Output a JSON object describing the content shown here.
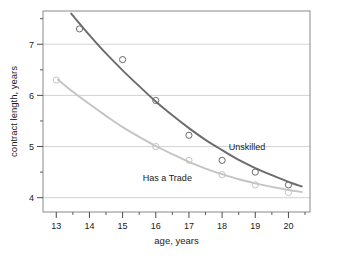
{
  "chart_data": {
    "type": "scatter",
    "title": "",
    "subtitle": "",
    "xlabel": "age, years",
    "ylabel": "contract length, years",
    "xlim": [
      12.6,
      20.65
    ],
    "ylim": [
      3.72,
      7.65
    ],
    "xticks": [
      13,
      14,
      15,
      16,
      17,
      18,
      19,
      20
    ],
    "xticklabels": [
      "13",
      "14",
      "15",
      "16",
      "17",
      "18",
      "19",
      "20"
    ],
    "yticks": [
      4,
      5,
      6,
      7
    ],
    "yticklabels": [
      "4",
      "5",
      "6",
      "7"
    ],
    "xminorticks": [
      13.5,
      14.5,
      15.5,
      16.5,
      17.5,
      18.5,
      19.5,
      20.5
    ],
    "yminorticks": [
      4.5,
      5.5,
      6.5,
      7.5
    ],
    "grid": "horizontal-major",
    "legend_position": "inline-annotations",
    "series": [
      {
        "name": "Unskilled",
        "color": "#6b6b6b",
        "marker": "open-circle",
        "annotation": "Unskilled",
        "annotation_x": 18.75,
        "annotation_y": 4.93,
        "points": [
          {
            "x": 13.7,
            "y": 7.3
          },
          {
            "x": 15.0,
            "y": 6.7
          },
          {
            "x": 16.0,
            "y": 5.9
          },
          {
            "x": 17.0,
            "y": 5.22
          },
          {
            "x": 18.0,
            "y": 4.73
          },
          {
            "x": 19.0,
            "y": 4.5
          },
          {
            "x": 20.0,
            "y": 4.25
          }
        ],
        "fit_curve": [
          {
            "x": 13.45,
            "y": 7.6
          },
          {
            "x": 14.0,
            "y": 7.18
          },
          {
            "x": 14.5,
            "y": 6.82
          },
          {
            "x": 15.0,
            "y": 6.49
          },
          {
            "x": 15.5,
            "y": 6.18
          },
          {
            "x": 16.0,
            "y": 5.88
          },
          {
            "x": 16.5,
            "y": 5.61
          },
          {
            "x": 17.0,
            "y": 5.36
          },
          {
            "x": 17.5,
            "y": 5.13
          },
          {
            "x": 18.0,
            "y": 4.93
          },
          {
            "x": 18.5,
            "y": 4.74
          },
          {
            "x": 19.0,
            "y": 4.58
          },
          {
            "x": 19.5,
            "y": 4.44
          },
          {
            "x": 20.0,
            "y": 4.31
          },
          {
            "x": 20.4,
            "y": 4.22
          }
        ]
      },
      {
        "name": "Has a Trade",
        "color": "#c4c4c4",
        "marker": "open-circle",
        "annotation": "Has a Trade",
        "annotation_x": 16.35,
        "annotation_y": 4.32,
        "points": [
          {
            "x": 13.0,
            "y": 6.3
          },
          {
            "x": 16.0,
            "y": 5.0
          },
          {
            "x": 17.0,
            "y": 4.73
          },
          {
            "x": 18.0,
            "y": 4.45
          },
          {
            "x": 19.0,
            "y": 4.25
          },
          {
            "x": 20.0,
            "y": 4.1
          }
        ],
        "fit_curve": [
          {
            "x": 13.05,
            "y": 6.31
          },
          {
            "x": 13.5,
            "y": 6.07
          },
          {
            "x": 14.0,
            "y": 5.83
          },
          {
            "x": 14.5,
            "y": 5.6
          },
          {
            "x": 15.0,
            "y": 5.38
          },
          {
            "x": 15.5,
            "y": 5.19
          },
          {
            "x": 16.0,
            "y": 5.01
          },
          {
            "x": 16.5,
            "y": 4.85
          },
          {
            "x": 17.0,
            "y": 4.7
          },
          {
            "x": 17.5,
            "y": 4.57
          },
          {
            "x": 18.0,
            "y": 4.46
          },
          {
            "x": 18.5,
            "y": 4.36
          },
          {
            "x": 19.0,
            "y": 4.28
          },
          {
            "x": 19.5,
            "y": 4.21
          },
          {
            "x": 20.0,
            "y": 4.15
          },
          {
            "x": 20.4,
            "y": 4.11
          }
        ]
      }
    ]
  }
}
